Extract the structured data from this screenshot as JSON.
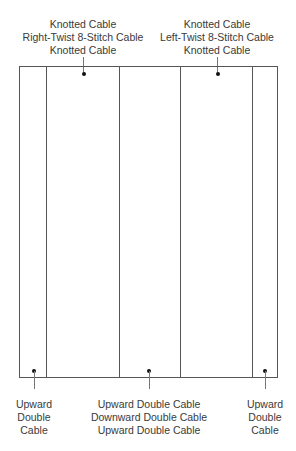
{
  "diagram": {
    "top_labels": [
      {
        "id": "top-left-group",
        "lines": [
          "Knotted Cable",
          "Right-Twist 8-Stitch Cable",
          "Knotted Cable"
        ]
      },
      {
        "id": "top-right-group",
        "lines": [
          "Knotted Cable",
          "Left-Twist 8-Stitch Cable",
          "Knotted Cable"
        ]
      }
    ],
    "bottom_labels": [
      {
        "id": "bottom-left-group",
        "lines": [
          "Upward",
          "Double",
          "Cable"
        ]
      },
      {
        "id": "bottom-center-group",
        "lines": [
          "Upward Double Cable",
          "Downward Double Cable",
          "Upward Double Cable"
        ]
      },
      {
        "id": "bottom-right-group",
        "lines": [
          "Upward",
          "Double",
          "Cable"
        ]
      }
    ],
    "panels": [
      {
        "index": 1,
        "name": "left-edge-panel",
        "x_start": 19,
        "x_end": 46
      },
      {
        "index": 2,
        "name": "right-twist-panel",
        "x_start": 46,
        "x_end": 119
      },
      {
        "index": 3,
        "name": "center-panel",
        "x_start": 119,
        "x_end": 180
      },
      {
        "index": 4,
        "name": "left-twist-panel",
        "x_start": 180,
        "x_end": 252
      },
      {
        "index": 5,
        "name": "right-edge-panel",
        "x_start": 252,
        "x_end": 278
      }
    ],
    "colors": {
      "line": "#555555",
      "dot": "#111111",
      "text": "#3a3a3a"
    }
  }
}
